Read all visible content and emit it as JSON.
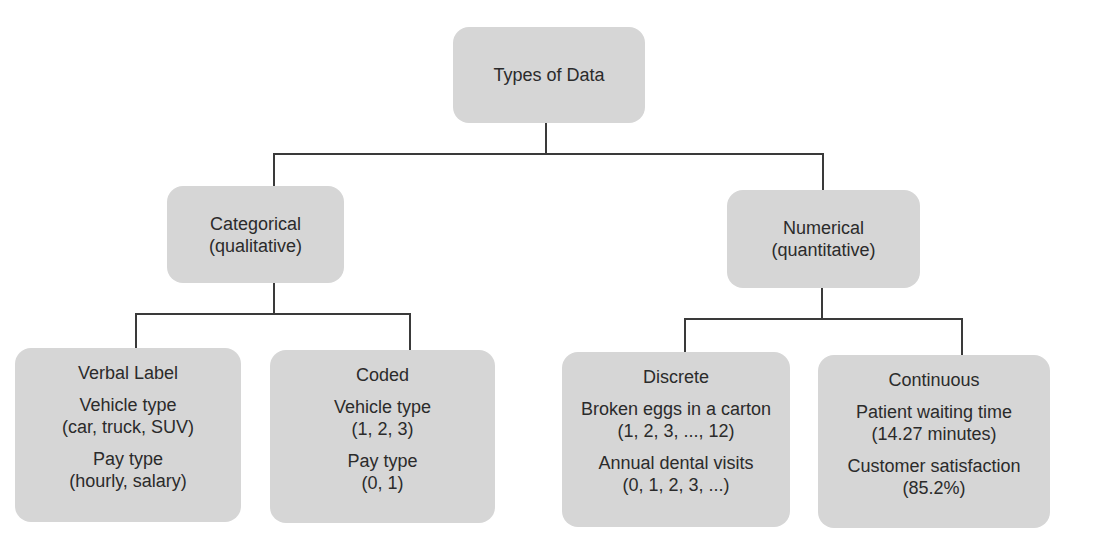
{
  "root": {
    "label": "Types of Data"
  },
  "branches": [
    {
      "label": "Categorical",
      "sublabel": "(qualitative)",
      "children": [
        {
          "title": "Verbal Label",
          "examples": [
            {
              "name": "Vehicle type",
              "values": "(car, truck, SUV)"
            },
            {
              "name": "Pay type",
              "values": "(hourly, salary)"
            }
          ]
        },
        {
          "title": "Coded",
          "examples": [
            {
              "name": "Vehicle type",
              "values": "(1, 2, 3)"
            },
            {
              "name": "Pay type",
              "values": "(0, 1)"
            }
          ]
        }
      ]
    },
    {
      "label": "Numerical",
      "sublabel": "(quantitative)",
      "children": [
        {
          "title": "Discrete",
          "examples": [
            {
              "name": "Broken eggs in a carton",
              "values": "(1, 2, 3, ..., 12)"
            },
            {
              "name": "Annual dental visits",
              "values": "(0, 1, 2, 3, ...)"
            }
          ]
        },
        {
          "title": "Continuous",
          "examples": [
            {
              "name": "Patient waiting time",
              "values": "(14.27 minutes)"
            },
            {
              "name": "Customer satisfaction",
              "values": "(85.2%)"
            }
          ]
        }
      ]
    }
  ],
  "colors": {
    "box_fill": "#d6d6d6",
    "line": "#3a3a3a",
    "text": "#2b2b2b",
    "background": "#ffffff"
  }
}
